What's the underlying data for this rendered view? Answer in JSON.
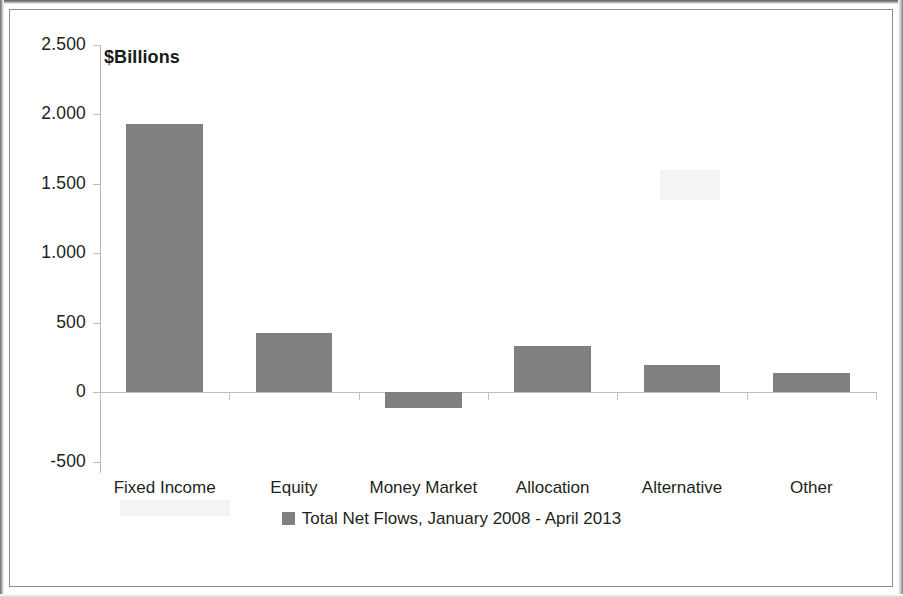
{
  "chart_data": {
    "type": "bar",
    "title": "",
    "axis_title": "$Billions",
    "xlabel": "",
    "ylabel": "$Billions",
    "categories": [
      "Fixed Income",
      "Equity",
      "Money Market",
      "Allocation",
      "Alternative",
      "Other"
    ],
    "values": [
      1925,
      425,
      -115,
      330,
      195,
      135
    ],
    "series": [
      {
        "name": "Total Net Flows, January 2008 - April 2013",
        "values": [
          1925,
          425,
          -115,
          330,
          195,
          135
        ]
      }
    ],
    "ylim": [
      -500,
      2500
    ],
    "ytick_values": [
      -500,
      0,
      500,
      1000,
      1500,
      2000,
      2500
    ],
    "ytick_labels": [
      "-500",
      "0",
      "500",
      "1.000",
      "1.500",
      "2.000",
      "2.500"
    ],
    "grid": false,
    "legend_position": "bottom",
    "legend_entries": [
      "Total Net Flows, January 2008 - April 2013"
    ],
    "bar_color": "#808080",
    "axis_color": "#bdbdbd",
    "text_color": "#231f20"
  },
  "legend": {
    "label": "Total Net Flows, January 2008 - April 2013",
    "swatch_name": "legend-swatch"
  }
}
